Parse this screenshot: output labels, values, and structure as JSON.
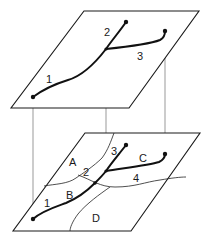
{
  "diagram": {
    "top_plane": {
      "segment_labels": {
        "s1": "1",
        "s2": "2",
        "s3": "3"
      }
    },
    "bottom_plane": {
      "segment_labels": {
        "s1": "1",
        "s2": "2",
        "s3": "3",
        "s4": "4"
      },
      "region_labels": {
        "A": "A",
        "B": "B",
        "C": "C",
        "D": "D"
      }
    },
    "colors": {
      "line": "#111111",
      "projection": "#555555",
      "background": "#ffffff"
    }
  }
}
